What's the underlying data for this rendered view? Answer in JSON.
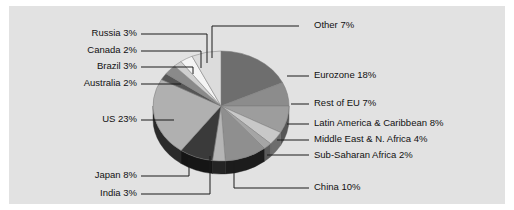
{
  "chart_data": {
    "type": "pie",
    "title": "",
    "subtitle": "",
    "xlabel": "",
    "ylabel": "",
    "legend_position": "callout-labels",
    "grid": false,
    "three_d": true,
    "unit": "%",
    "background_color": "#e2e2e2",
    "text_color": "#111111",
    "leader_line_color": "#1a1a1a",
    "categories": [
      "Eurozone",
      "Rest of EU",
      "Latin America & Caribbean",
      "Middle East & N. Africa",
      "Sub-Saharan Africa",
      "China",
      "India",
      "Japan",
      "US",
      "Australia",
      "Brazil",
      "Canada",
      "Russia",
      "Other"
    ],
    "values": [
      18,
      7,
      8,
      4,
      2,
      10,
      3,
      8,
      23,
      2,
      3,
      2,
      3,
      7
    ],
    "slices": [
      {
        "label": "Eurozone",
        "value": 18,
        "text": "Eurozone 18%",
        "color": "#6e6e6e",
        "side_color": "#3f3f3f",
        "side": "right"
      },
      {
        "label": "Rest of EU",
        "value": 7,
        "text": "Rest of EU 7%",
        "color": "#8c8c8c",
        "side_color": "#4e4e4e",
        "side": "right"
      },
      {
        "label": "Latin America & Caribbean",
        "value": 8,
        "text": "Latin America & Caribbean 8%",
        "color": "#9d9d9d",
        "side_color": "#565656",
        "side": "right"
      },
      {
        "label": "Middle East & N. Africa",
        "value": 4,
        "text": "Middle East & N. Africa 4%",
        "color": "#c8c8c8",
        "side_color": "#6d6d6d",
        "side": "right"
      },
      {
        "label": "Sub-Saharan Africa",
        "value": 2,
        "text": "Sub-Saharan Africa 2%",
        "color": "#a5a5a5",
        "side_color": "#5a5a5a",
        "side": "right"
      },
      {
        "label": "China",
        "value": 10,
        "text": "China 10%",
        "color": "#8f8f8f",
        "side_color": "#1c1c1c",
        "side": "bottom"
      },
      {
        "label": "India",
        "value": 3,
        "text": "India 3%",
        "color": "#b5b5b5",
        "side_color": "#242424",
        "side": "bottom"
      },
      {
        "label": "Japan",
        "value": 8,
        "text": "Japan 8%",
        "color": "#3a3a3a",
        "side_color": "#151515",
        "side": "bottom"
      },
      {
        "label": "US",
        "value": 23,
        "text": "US 23%",
        "color": "#b0b0b0",
        "side_color": "#2a2a2a",
        "side": "left"
      },
      {
        "label": "Australia",
        "value": 2,
        "text": "Australia 2%",
        "color": "#555555",
        "side_color": "#333333",
        "side": "left"
      },
      {
        "label": "Brazil",
        "value": 3,
        "text": "Brazil 3%",
        "color": "#8a8a8a",
        "side_color": "#4a4a4a",
        "side": "left"
      },
      {
        "label": "Canada",
        "value": 2,
        "text": "Canada 2%",
        "color": "#cfcfcf",
        "side_color": "#7a7a7a",
        "side": "left"
      },
      {
        "label": "Russia",
        "value": 3,
        "text": "Russia 3%",
        "color": "#f4f4f4",
        "side_color": "#bcbcbc",
        "side": "left"
      },
      {
        "label": "Other",
        "value": 7,
        "text": "Other 7%",
        "color": "#dcdcdc",
        "side_color": "#9a9a9a",
        "side": "top"
      }
    ]
  },
  "labels": {
    "russia": "Russia 3%",
    "canada": "Canada 2%",
    "brazil": "Brazil 3%",
    "australia": "Australia 2%",
    "us": "US 23%",
    "japan": "Japan 8%",
    "india": "India 3%",
    "other": "Other 7%",
    "eurozone": "Eurozone 18%",
    "rest_of_eu": "Rest of EU 7%",
    "latin_america": "Latin America & Caribbean 8%",
    "middle_east": "Middle East & N. Africa 4%",
    "sub_saharan": "Sub-Saharan Africa 2%",
    "china": "China 10%"
  }
}
